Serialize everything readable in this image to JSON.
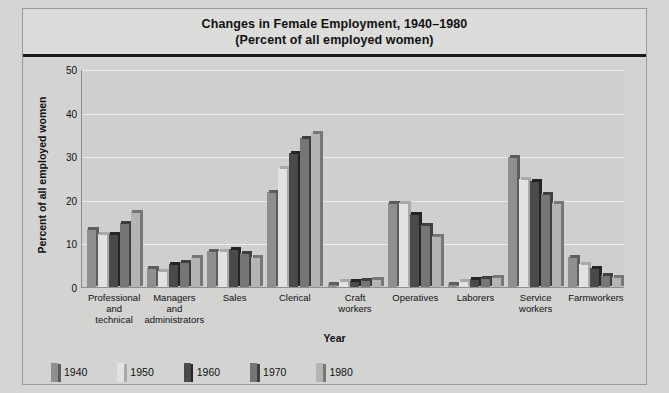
{
  "chart_data": {
    "type": "bar",
    "title": "Changes in Female Employment, 1940–1980",
    "subtitle": "(Percent of all employed women)",
    "xlabel": "Year",
    "ylabel": "Percent of all employed women",
    "ylim": [
      0,
      50
    ],
    "yticks": [
      0,
      10,
      20,
      30,
      40,
      50
    ],
    "grid": true,
    "legend_position": "bottom-left",
    "categories": [
      "Professional\nand\ntechnical",
      "Managers\nand\nadministrators",
      "Sales",
      "Clerical",
      "Craft\nworkers",
      "Operatives",
      "Laborers",
      "Service\nworkers",
      "Farmworkers"
    ],
    "series": [
      {
        "name": "1940",
        "color": "#8f8f8d",
        "side_color": "#5d5d5b",
        "values": [
          13.5,
          4.5,
          8.5,
          22.0,
          1.0,
          19.5,
          1.0,
          30.0,
          7.0
        ]
      },
      {
        "name": "1950",
        "color": "#e2e2e0",
        "side_color": "#a9a9a7",
        "values": [
          12.5,
          4.0,
          8.5,
          27.5,
          1.5,
          19.5,
          1.5,
          25.0,
          5.5
        ]
      },
      {
        "name": "1960",
        "color": "#4a4a48",
        "side_color": "#242422",
        "values": [
          12.5,
          5.5,
          9.0,
          31.0,
          1.5,
          17.0,
          2.0,
          24.5,
          4.5
        ]
      },
      {
        "name": "1970",
        "color": "#767674",
        "side_color": "#3f3f3d",
        "values": [
          15.0,
          6.0,
          8.0,
          34.5,
          1.8,
          14.5,
          2.3,
          21.5,
          3.0
        ]
      },
      {
        "name": "1980",
        "color": "#b4b4b2",
        "side_color": "#777775",
        "values": [
          17.5,
          7.0,
          7.0,
          35.5,
          2.0,
          12.0,
          2.5,
          19.5,
          2.5
        ]
      }
    ]
  }
}
